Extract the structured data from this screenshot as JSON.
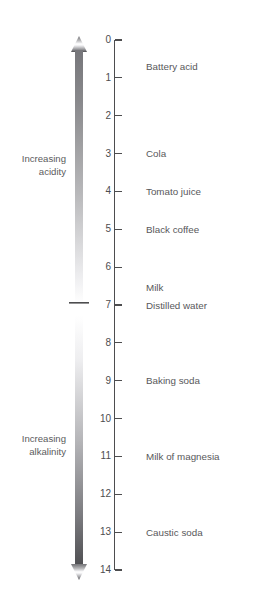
{
  "figure": {
    "axis": {
      "label": "pH",
      "min": 0,
      "max": 14,
      "orientation": "vertical",
      "direction": "increasing-downward",
      "tick_labels": [
        "0",
        "1",
        "2",
        "3",
        "4",
        "5",
        "6",
        "7",
        "8",
        "9",
        "10",
        "11",
        "12",
        "13",
        "14"
      ],
      "line_color": "#4d4d4f"
    },
    "direction_labels": [
      {
        "name": "increasing-acidity",
        "text": "Increasing\nacidity",
        "at_ph": 3
      },
      {
        "name": "increasing-alkalinity",
        "text": "Increasing\nalkalinity",
        "at_ph": 10.4
      }
    ],
    "gradient_bar": {
      "top_color": "#7f7f82",
      "mid_color": "#ffffff",
      "bottom_color": "#58585a",
      "neutral_marker_ph": 7,
      "arrowheads": "both"
    }
  },
  "chart_data": {
    "type": "scatter",
    "xlabel": "",
    "ylabel": "pH",
    "ylim": [
      0,
      14
    ],
    "grid": false,
    "legend": "none",
    "tick_values": [
      0,
      1,
      2,
      3,
      4,
      5,
      6,
      7,
      8,
      9,
      10,
      11,
      12,
      13,
      14
    ],
    "tick_labels": [
      "0",
      "1",
      "2",
      "3",
      "4",
      "5",
      "6",
      "7",
      "8",
      "9",
      "10",
      "11",
      "12",
      "13",
      "14"
    ],
    "categories": [
      "Battery acid",
      "Cola",
      "Tomato juice",
      "Black coffee",
      "Milk",
      "Distilled water",
      "Baking soda",
      "Milk of magnesia",
      "Caustic soda"
    ],
    "values": [
      0.7,
      3,
      4,
      5,
      6.55,
      7,
      9,
      11,
      13
    ],
    "annotations": [
      "Increasing acidity",
      "Increasing alkalinity"
    ],
    "substances": [
      {
        "label": "Battery acid",
        "ph": 0.7
      },
      {
        "label": "Cola",
        "ph": 3
      },
      {
        "label": "Tomato juice",
        "ph": 4
      },
      {
        "label": "Black coffee",
        "ph": 5
      },
      {
        "label": "Milk",
        "ph": 6.55
      },
      {
        "label": "Distilled water",
        "ph": 7
      },
      {
        "label": "Baking soda",
        "ph": 9
      },
      {
        "label": "Milk of magnesia",
        "ph": 11
      },
      {
        "label": "Caustic soda",
        "ph": 13
      }
    ]
  }
}
